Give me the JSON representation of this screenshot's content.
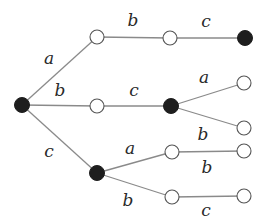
{
  "diagram": {
    "type": "tree",
    "nodes": [
      {
        "id": "root",
        "x": 22,
        "y": 105,
        "filled": true
      },
      {
        "id": "n1",
        "x": 97,
        "y": 37,
        "filled": false
      },
      {
        "id": "n2",
        "x": 170,
        "y": 38,
        "filled": false
      },
      {
        "id": "n3",
        "x": 245,
        "y": 38,
        "filled": true
      },
      {
        "id": "n4",
        "x": 97,
        "y": 106,
        "filled": false
      },
      {
        "id": "n5",
        "x": 171,
        "y": 106,
        "filled": true
      },
      {
        "id": "n6",
        "x": 244,
        "y": 83,
        "filled": false
      },
      {
        "id": "n7",
        "x": 244,
        "y": 128,
        "filled": false
      },
      {
        "id": "n8",
        "x": 97,
        "y": 173,
        "filled": true
      },
      {
        "id": "n9",
        "x": 172,
        "y": 152,
        "filled": false
      },
      {
        "id": "n10",
        "x": 244,
        "y": 151,
        "filled": false
      },
      {
        "id": "n11",
        "x": 172,
        "y": 197,
        "filled": false
      },
      {
        "id": "n12",
        "x": 244,
        "y": 196,
        "filled": false
      }
    ],
    "edges": [
      {
        "from": "root",
        "to": "n1",
        "label": "a"
      },
      {
        "from": "n1",
        "to": "n2",
        "label": "b"
      },
      {
        "from": "n2",
        "to": "n3",
        "label": "c"
      },
      {
        "from": "root",
        "to": "n4",
        "label": "b"
      },
      {
        "from": "n4",
        "to": "n5",
        "label": "c"
      },
      {
        "from": "n5",
        "to": "n6",
        "label": "a"
      },
      {
        "from": "n5",
        "to": "n7",
        "label": "b"
      },
      {
        "from": "root",
        "to": "n8",
        "label": "c"
      },
      {
        "from": "n8",
        "to": "n9",
        "label": "a"
      },
      {
        "from": "n9",
        "to": "n10",
        "label": "b"
      },
      {
        "from": "n8",
        "to": "n11",
        "label": "b"
      },
      {
        "from": "n11",
        "to": "n12",
        "label": "c"
      }
    ],
    "labels": {
      "e_root_n1": "a",
      "e_n1_n2": "b",
      "e_n2_n3": "c",
      "e_root_n4": "b",
      "e_n4_n5": "c",
      "e_n5_n6": "a",
      "e_n5_n7": "b",
      "e_root_n8": "c",
      "e_n8_n9": "a",
      "e_n9_n10": "b",
      "e_n8_n11": "b",
      "e_n11_n12": "c"
    },
    "colors": {
      "edge": "#8a8a8a",
      "filled_node": "#1e1e1e",
      "open_node_stroke": "#555555"
    }
  }
}
